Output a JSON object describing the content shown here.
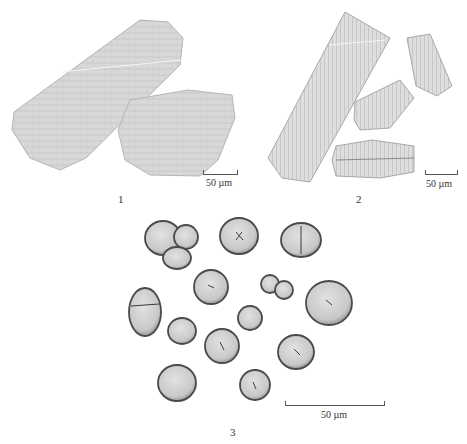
{
  "figure": {
    "panels": [
      {
        "id": "1",
        "label": "1",
        "scale_label": "50 µm",
        "description": "two large rectangular textured fragments"
      },
      {
        "id": "2",
        "label": "2",
        "scale_label": "50 µm",
        "description": "four elongated ribbed fragments"
      },
      {
        "id": "3",
        "label": "3",
        "scale_label": "50 µm",
        "description": "fourteen rounded grains, some compound"
      }
    ],
    "colors": {
      "fill_panel1": "#d6d6d6",
      "fill_panel2": "#dcdcdc",
      "grain_fill": "#cfcfcf",
      "grain_edge": "#555555",
      "text": "#333333"
    }
  }
}
